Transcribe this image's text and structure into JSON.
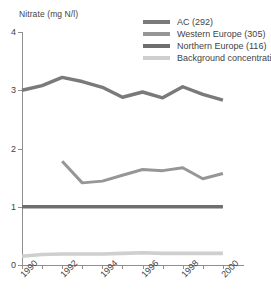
{
  "chart_data": {
    "type": "line",
    "title": "",
    "xlabel": "",
    "ylabel": "Nitrate (mg N/l)",
    "xlim": [
      1990,
      2001
    ],
    "ylim": [
      0,
      4
    ],
    "grid": false,
    "legend_position": "top-right",
    "x": [
      1990,
      1991,
      1992,
      1993,
      1994,
      1995,
      1996,
      1997,
      1998,
      1999,
      2000
    ],
    "yticks": [
      "0",
      "1",
      "2",
      "3",
      "4"
    ],
    "ytick_values": [
      0,
      1,
      2,
      3,
      4
    ],
    "xticks_all": [
      1990,
      1991,
      1992,
      1993,
      1994,
      1995,
      1996,
      1997,
      1998,
      1999,
      2000
    ],
    "xticks_labeled": [
      "1990",
      "1992",
      "1994",
      "1996",
      "1998",
      "2000"
    ],
    "xticks_labeled_values": [
      1990,
      1992,
      1994,
      1996,
      1998,
      2000
    ],
    "series": [
      {
        "name": "AC (292)",
        "color": "#7a7a7a",
        "x": [
          1990,
          1991,
          1992,
          1993,
          1994,
          1995,
          1996,
          1997,
          1998,
          1999,
          2000
        ],
        "values": [
          3.0,
          3.08,
          3.22,
          3.15,
          3.05,
          2.88,
          2.97,
          2.87,
          3.06,
          2.93,
          2.83
        ]
      },
      {
        "name": "Western Europe (305)",
        "color": "#969696",
        "x": [
          1992,
          1993,
          1994,
          1995,
          1996,
          1997,
          1998,
          1999,
          2000
        ],
        "values": [
          1.78,
          1.41,
          1.44,
          1.54,
          1.64,
          1.62,
          1.67,
          1.48,
          1.57
        ]
      },
      {
        "name": "Northern Europe (116)",
        "color": "#6e6e6e",
        "x": [
          1990,
          1991,
          1992,
          1993,
          1994,
          1995,
          1996,
          1997,
          1998,
          1999,
          2000
        ],
        "values": [
          1.0,
          1.0,
          1.0,
          1.0,
          1.0,
          1.0,
          1.0,
          1.0,
          1.0,
          1.0,
          1.0
        ]
      },
      {
        "name": "Background concentration",
        "color": "#cfcfcf",
        "x": [
          1990,
          1991,
          1992,
          1993,
          1994,
          1995,
          1996,
          1997,
          1998,
          1999,
          2000
        ],
        "values": [
          0.15,
          0.18,
          0.19,
          0.19,
          0.19,
          0.2,
          0.21,
          0.2,
          0.2,
          0.2,
          0.2
        ]
      }
    ]
  },
  "axis": {
    "y_title": "Nitrate (mg N/l)"
  },
  "legend": {
    "items": [
      {
        "label": "AC (292)",
        "color": "#7a7a7a"
      },
      {
        "label": "Western Europe (305)",
        "color": "#969696"
      },
      {
        "label": "Northern Europe (116)",
        "color": "#6e6e6e"
      },
      {
        "label": "Background concentration",
        "color": "#cfcfcf"
      }
    ]
  }
}
